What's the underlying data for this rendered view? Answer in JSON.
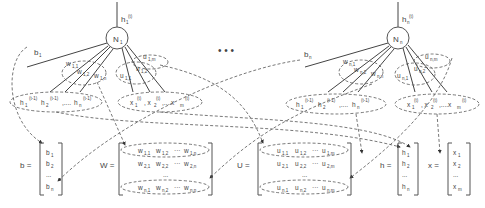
{
  "diagram": {
    "ellipsis": "• • •",
    "neuron1": {
      "label": "N",
      "sub": "1",
      "output": "h",
      "output_sub": "1",
      "output_sup": "(t)",
      "bias": "b",
      "bias_sub": "1",
      "w_labels": [
        "w1,1",
        "w1,2",
        "w1,n"
      ],
      "u_labels": [
        "u1,1",
        "u1,2",
        "u1,m"
      ]
    },
    "neuronN": {
      "label": "N",
      "sub": "n",
      "output": "h",
      "output_sub": "n",
      "output_sup": "(t)",
      "bias": "b",
      "bias_sub": "n",
      "w_labels": [
        "wn,1",
        "wn,2",
        "wn,n"
      ],
      "u_labels": [
        "un,1",
        "un,2",
        "un,m"
      ]
    },
    "h_prev_group": "h1(t-1), h2(t-1), ..., hn(t-1)",
    "x_group": "x1(t), x2(t), ..., xm(t)",
    "matrices": {
      "b": {
        "name": "b =",
        "rows": [
          "b1",
          "b2",
          "...",
          "bn"
        ]
      },
      "W": {
        "name": "W =",
        "rows": [
          "w1,1  w1,2  ...  w1,n",
          "w2,1  w2,2  ...  w2,n",
          "...",
          "wn,1  wn,2  ...  wn,n"
        ]
      },
      "U": {
        "name": "U =",
        "rows": [
          "u1,1  u1,2  ...  u1,m",
          "u2,1  u2,2  ...  u2,m",
          "...",
          "un,1  un,2  ...  un,m"
        ]
      },
      "h": {
        "name": "h =",
        "rows": [
          "h1",
          "h2",
          "...",
          "hn"
        ]
      },
      "x": {
        "name": "x =",
        "rows": [
          "x1",
          "x2",
          "...",
          "xm"
        ]
      }
    }
  }
}
